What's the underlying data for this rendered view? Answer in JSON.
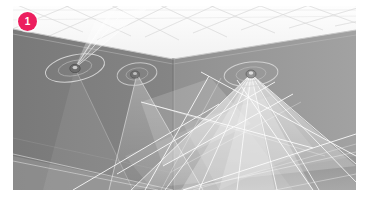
{
  "viewport": {
    "name": "3d-scene-viewport",
    "description": "3D rendered room interior with ceiling-mounted spotlights casting volumetric light cones",
    "frame": {
      "x": 13,
      "y": 6,
      "width": 343,
      "height": 184
    },
    "background_color": "#808080"
  },
  "badge": {
    "label": "1",
    "color": "#ec1e5e",
    "text_color": "#ffffff",
    "position": {
      "x": 18,
      "y": 12,
      "size": 19
    }
  },
  "scene": {
    "surfaces": [
      {
        "name": "ceiling-plane",
        "color": "#fbfbfb",
        "grid": true,
        "grid_color": "#d9d9d9"
      },
      {
        "name": "left-wall",
        "color": "#7d7d7d"
      },
      {
        "name": "back-wall",
        "color": "#8a8a8a"
      },
      {
        "name": "right-wall",
        "color": "#9d9d9d"
      },
      {
        "name": "floor",
        "color": "#a3a3a3"
      }
    ],
    "edge_color": "#b9b9b9",
    "corner_edge_color": "#6f6f6f"
  },
  "lights": [
    {
      "name": "spotlight-1",
      "index": "1",
      "fixture": {
        "x": 62,
        "y": 62
      },
      "gizmo_ring": {
        "rx": 30,
        "ry": 13,
        "rotation": -12,
        "color": "#d8d8d8"
      },
      "cone": {
        "color": "#ffffff",
        "opacity": 0.35
      }
    },
    {
      "name": "spotlight-2",
      "index": "2",
      "fixture": {
        "x": 124,
        "y": 68
      },
      "gizmo_ring": {
        "rx": 20,
        "ry": 11,
        "rotation": -8,
        "color": "#cfcfcf"
      },
      "cone": {
        "color": "#ffffff",
        "opacity": 0.22
      }
    },
    {
      "name": "spotlight-3",
      "index": "3",
      "fixture": {
        "x": 238,
        "y": 68
      },
      "gizmo_ring": {
        "rx": 27,
        "ry": 12,
        "rotation": -6,
        "color": "#d4d4d4"
      },
      "cone": {
        "color": "#ffffff",
        "opacity": 0.4
      }
    }
  ]
}
